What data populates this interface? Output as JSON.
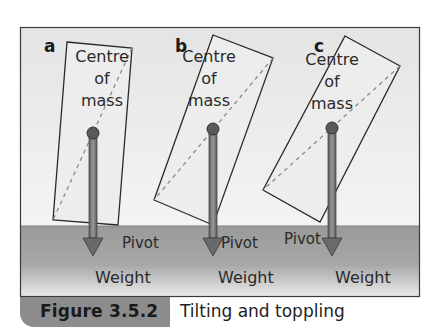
{
  "figure": {
    "number": "Figure 3.5.2",
    "caption": "Tilting and toppling",
    "colors": {
      "sky": "#ececec",
      "ground": "#9a9a9a",
      "ground_light": "#e6e6e6",
      "box_fill": "#ededed",
      "outline": "#2a2a2a",
      "arrow": "#6a6a6a",
      "dot": "#5a5a5a",
      "caption_bar": "#8c8c8c"
    },
    "panels": [
      {
        "id": "a",
        "label": "a",
        "com_text": [
          "Centre",
          "of",
          "mass"
        ],
        "pivot_label": "Pivot",
        "weight_label": "Weight",
        "box_points": "67,42 132,48 118,225 53,220",
        "diag": "132,48 53,220",
        "com": [
          93,
          133
        ],
        "arrow_x": 93,
        "pivot_xy": [
          122,
          248
        ],
        "weight_xy": [
          95,
          283
        ],
        "letter_xy": [
          44,
          52
        ],
        "com_text_x": 102,
        "com_text_y": 62
      },
      {
        "id": "b",
        "label": "b",
        "com_text": [
          "Centre",
          "of",
          "mass"
        ],
        "pivot_label": "Pivot",
        "weight_label": "Weight",
        "box_points": "213,35 273,58 213,225 154,200",
        "diag": "273,58 154,200",
        "com": [
          213,
          129
        ],
        "arrow_x": 213,
        "pivot_xy": [
          221,
          248
        ],
        "weight_xy": [
          218,
          283
        ],
        "letter_xy": [
          175,
          52
        ],
        "com_text_x": 209,
        "com_text_y": 62
      },
      {
        "id": "c",
        "label": "c",
        "com_text": [
          "Centre",
          "of",
          "mass"
        ],
        "pivot_label": "Pivot",
        "weight_label": "Weight",
        "box_points": "345,36 400,66 320,222 263,190",
        "diag": "400,66 263,190",
        "com": [
          332,
          128
        ],
        "arrow_x": 332,
        "pivot_xy": [
          284,
          244
        ],
        "weight_xy": [
          335,
          283
        ],
        "letter_xy": [
          314,
          52
        ],
        "com_text_x": 332,
        "com_text_y": 65
      }
    ]
  }
}
